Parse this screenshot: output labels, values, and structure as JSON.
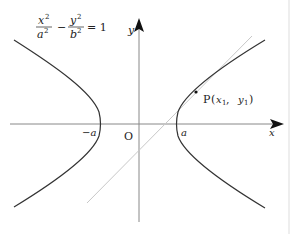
{
  "figure": {
    "equation": {
      "lhs_term1_num": "x",
      "lhs_term1_den": "a",
      "minus": "−",
      "lhs_term2_num": "y",
      "lhs_term2_den": "b",
      "exponent": "2",
      "equals": "= 1"
    },
    "axes": {
      "x_label": "x",
      "y_label": "y",
      "origin_label": "O"
    },
    "vertices": {
      "left_label": "−a",
      "right_label": "a"
    },
    "point": {
      "name": "P",
      "open": "(",
      "x": "x",
      "x_sub": "1",
      "sep": ",",
      "y": "y",
      "y_sub": "1",
      "close": ")"
    },
    "colors": {
      "curve": "#333333",
      "axis": "#888888",
      "tangent": "#c8c8c8",
      "border": "#dddddd"
    }
  }
}
